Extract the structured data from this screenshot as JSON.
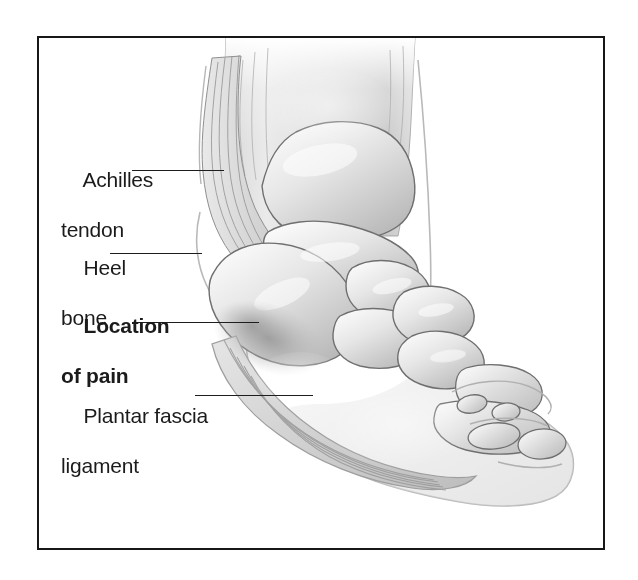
{
  "figure": {
    "frame_color": "#171717",
    "background_color": "#ffffff",
    "ink_color": "#1b1b1b",
    "illustration_style": "grayscale medical line-and-wash illustration"
  },
  "labels": [
    {
      "id": "achilles-tendon",
      "line1": "Achilles",
      "line2": "tendon",
      "bold": false,
      "leader": {
        "x1": 132,
        "y1": 170,
        "x2": 224,
        "y2": 170
      }
    },
    {
      "id": "heel-bone",
      "line1": "Heel",
      "line2": "bone",
      "bold": false,
      "leader": {
        "x1": 110,
        "y1": 253,
        "x2": 202,
        "y2": 253
      }
    },
    {
      "id": "location-of-pain",
      "line1": "Location",
      "line2": "of pain",
      "bold": true,
      "leader": {
        "x1": 138,
        "y1": 322,
        "x2": 259,
        "y2": 322
      }
    },
    {
      "id": "plantar-fascia-ligament",
      "line1": "Plantar fascia",
      "line2": "ligament",
      "bold": false,
      "leader": {
        "x1": 195,
        "y1": 395,
        "x2": 313,
        "y2": 395
      }
    }
  ],
  "anatomy_parts": [
    "lower leg / shin",
    "Achilles tendon",
    "calcaneus (heel bone)",
    "talus",
    "navicular",
    "cuneiform bones",
    "cuboid",
    "metatarsals",
    "phalanges (toes)",
    "plantar fascia ligament",
    "pain shading at plantar fascia insertion"
  ]
}
